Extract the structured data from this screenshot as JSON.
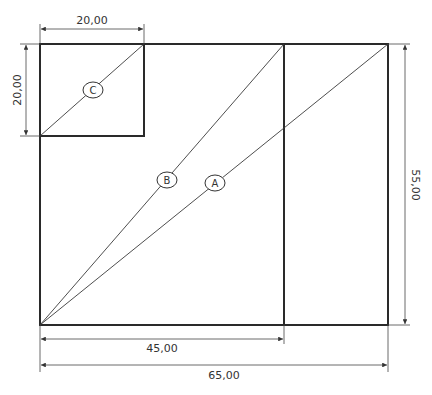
{
  "diagram": {
    "dimensions": {
      "top_width": "20,00",
      "left_height": "20,00",
      "right_height": "55,00",
      "bottom_inner": "45,00",
      "bottom_total": "65,00"
    },
    "labels": {
      "a": "A",
      "b": "B",
      "c": "C"
    },
    "colors": {
      "line": "#2a2a2a",
      "background": "#ffffff"
    }
  }
}
